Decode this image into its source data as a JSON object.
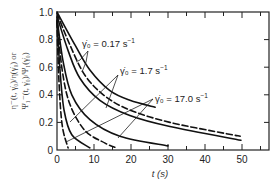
{
  "chart_data": {
    "type": "line",
    "title": "",
    "xlabel": "t (s)",
    "ylabel_line1": "η⁻(t, γ̇₀)/η(γ̇₀) or",
    "ylabel_line2": "Ψ₁⁻(t, γ̇₀)/Ψ₁(γ̇₀)",
    "xlim": [
      0,
      57
    ],
    "ylim": [
      0,
      1.0
    ],
    "xticks": [
      0,
      10,
      20,
      30,
      40,
      50
    ],
    "xtick_labels": [
      "0",
      "10",
      "20",
      "30",
      "40",
      "50"
    ],
    "yticks": [
      0,
      0.2,
      0.4,
      0.6,
      0.8,
      1.0
    ],
    "ytick_labels": [
      "0",
      "0.2",
      "0.4",
      "0.6",
      "0.8",
      "1.0"
    ],
    "grid": false,
    "legend": "none (inline annotations with arrows)",
    "annotations": [
      {
        "text": "γ̇₀ = 0.17 s⁻¹",
        "rate": "0.17"
      },
      {
        "text": "γ̇₀ = 1.7 s⁻¹",
        "rate": "1.7"
      },
      {
        "text": "γ̇₀ = 17.0 s⁻¹",
        "rate": "17.0"
      }
    ],
    "series": [
      {
        "name": "0.17 s⁻¹ solid (η⁻/η)",
        "style": "solid",
        "x": [
          0,
          4.9,
          8.9,
          14.3,
          19.7,
          26.5
        ],
        "y": [
          1.0,
          0.76,
          0.58,
          0.43,
          0.36,
          0.31
        ]
      },
      {
        "name": "0.17 s⁻¹ dashed (Ψ₁⁻/Ψ₁)",
        "style": "dashed",
        "x": [
          0,
          3.5,
          7.6,
          13,
          19.7,
          30.5,
          45.4,
          49.5
        ],
        "y": [
          0.99,
          0.76,
          0.54,
          0.39,
          0.29,
          0.2,
          0.12,
          0.1
        ]
      },
      {
        "name": "1.7 s⁻¹ solid (η⁻/η)",
        "style": "solid",
        "x": [
          0,
          3,
          6.2,
          11.6,
          19.7,
          30.5,
          49.7
        ],
        "y": [
          0.97,
          0.72,
          0.52,
          0.36,
          0.25,
          0.17,
          0.07
        ]
      },
      {
        "name": "1.7 s⁻¹ solid short (η⁻/η)",
        "style": "solid",
        "x": [
          0,
          1.6,
          4,
          8.9,
          17,
          30
        ],
        "y": [
          0.96,
          0.65,
          0.4,
          0.22,
          0.1,
          0.03
        ]
      },
      {
        "name": "1.7 s⁻¹ dashed (Ψ₁⁻/Ψ₁)",
        "style": "dashed",
        "x": [
          0,
          1.4,
          3.5,
          7.6,
          13,
          16.2
        ],
        "y": [
          0.94,
          0.58,
          0.33,
          0.14,
          0.05,
          0.015
        ]
      },
      {
        "name": "17.0 s⁻¹ solid (η⁻/η)",
        "style": "solid",
        "x": [
          0,
          0.8,
          1.9,
          4,
          8.9
        ],
        "y": [
          0.94,
          0.58,
          0.29,
          0.11,
          0.015
        ]
      },
      {
        "name": "17.0 s⁻¹ dashed (Ψ₁⁻/Ψ₁)",
        "style": "dashed",
        "x": [
          0,
          0.5,
          1.4,
          3
        ],
        "y": [
          0.93,
          0.51,
          0.18,
          0.015
        ]
      }
    ]
  },
  "labels": {
    "ann_017": "γ̇₀ = 0.17 s",
    "ann_17": "γ̇₀ = 1.7 s",
    "ann_170": "γ̇₀ = 17.0 s",
    "sup": "−1"
  }
}
